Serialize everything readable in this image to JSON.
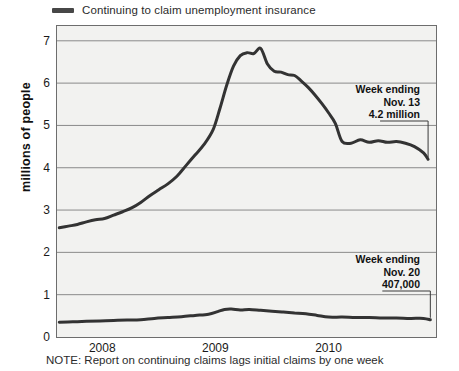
{
  "legend": {
    "swatch_color": "#474747",
    "label": "Continuing to claim unemployment insurance"
  },
  "axes": {
    "y_title": "millions of people",
    "y_ticks": [
      "0",
      "1",
      "2",
      "3",
      "4",
      "5",
      "6",
      "7"
    ],
    "x_ticks": [
      "2008",
      "2009",
      "2010"
    ]
  },
  "annotations": {
    "continuing": {
      "line1": "Week ending",
      "line2": "Nov. 13",
      "line3": "4.2 million"
    },
    "initial": {
      "line1": "Week ending",
      "line2": "Nov. 20",
      "line3": "407,000"
    }
  },
  "note": "NOTE: Report on continuing claims lags initial claims by one week",
  "chart_data": {
    "type": "line",
    "title": "",
    "xlabel": "",
    "ylabel": "millions of people",
    "ylim": [
      0,
      7.35
    ],
    "xlim": [
      2007.6,
      2010.95
    ],
    "grid": true,
    "legend_position": "top-left",
    "x_tick_values": [
      2008,
      2009,
      2010
    ],
    "x_tick_labels": [
      "2008",
      "2009",
      "2010"
    ],
    "y_tick_values": [
      0,
      1,
      2,
      3,
      4,
      5,
      6,
      7
    ],
    "series": [
      {
        "name": "Continuing to claim unemployment insurance",
        "color": "#333333",
        "units": "millions of people",
        "last_value_label": "4.2 million",
        "last_value_date": "Week ending Nov. 13",
        "x": [
          2007.62,
          2007.7,
          2007.78,
          2007.86,
          2007.94,
          2008.02,
          2008.1,
          2008.18,
          2008.26,
          2008.34,
          2008.42,
          2008.5,
          2008.58,
          2008.66,
          2008.74,
          2008.82,
          2008.9,
          2008.98,
          2009.04,
          2009.1,
          2009.16,
          2009.22,
          2009.28,
          2009.34,
          2009.4,
          2009.46,
          2009.52,
          2009.58,
          2009.64,
          2009.7,
          2009.76,
          2009.82,
          2009.88,
          2009.94,
          2010.0,
          2010.06,
          2010.12,
          2010.2,
          2010.28,
          2010.36,
          2010.44,
          2010.52,
          2010.6,
          2010.68,
          2010.76,
          2010.84,
          2010.88
        ],
        "y": [
          2.58,
          2.62,
          2.66,
          2.72,
          2.77,
          2.8,
          2.88,
          2.96,
          3.05,
          3.18,
          3.34,
          3.48,
          3.62,
          3.8,
          4.05,
          4.3,
          4.55,
          4.9,
          5.4,
          5.95,
          6.4,
          6.65,
          6.72,
          6.7,
          6.82,
          6.45,
          6.28,
          6.26,
          6.2,
          6.18,
          6.05,
          5.9,
          5.72,
          5.52,
          5.3,
          5.05,
          4.62,
          4.58,
          4.66,
          4.6,
          4.64,
          4.6,
          4.62,
          4.58,
          4.5,
          4.35,
          4.2
        ]
      },
      {
        "name": "Initial claims",
        "color": "#333333",
        "units": "millions of people",
        "last_value_label": "407,000",
        "last_value_date": "Week ending Nov. 20",
        "x": [
          2007.62,
          2007.74,
          2007.86,
          2007.98,
          2008.1,
          2008.22,
          2008.34,
          2008.46,
          2008.58,
          2008.7,
          2008.82,
          2008.94,
          2009.02,
          2009.08,
          2009.14,
          2009.22,
          2009.3,
          2009.4,
          2009.5,
          2009.6,
          2009.7,
          2009.8,
          2009.9,
          2010.0,
          2010.12,
          2010.24,
          2010.36,
          2010.48,
          2010.6,
          2010.72,
          2010.84,
          2010.9
        ],
        "y": [
          0.35,
          0.36,
          0.37,
          0.38,
          0.39,
          0.4,
          0.41,
          0.44,
          0.46,
          0.48,
          0.51,
          0.54,
          0.6,
          0.65,
          0.66,
          0.64,
          0.65,
          0.63,
          0.61,
          0.59,
          0.57,
          0.55,
          0.51,
          0.47,
          0.47,
          0.46,
          0.46,
          0.45,
          0.45,
          0.44,
          0.44,
          0.407
        ]
      }
    ]
  }
}
